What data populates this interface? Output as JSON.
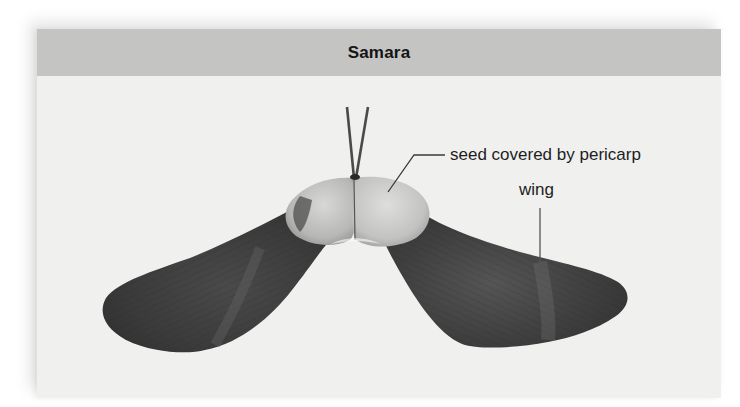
{
  "panel": {
    "title": "Samara"
  },
  "figure": {
    "labels": [
      {
        "id": "seed",
        "text": "seed covered by pericarp"
      },
      {
        "id": "wing",
        "text": "wing"
      }
    ]
  },
  "colors": {
    "page_background": "#ffffff",
    "panel_background": "#f0f0ef",
    "header_background": "#c4c4c3",
    "title_text": "#141414",
    "label_text": "#1e1e1e",
    "leader_line": "#3a3a3a",
    "wing_dark": "#3d3d3d",
    "seed_light": "#c9c9c7"
  }
}
